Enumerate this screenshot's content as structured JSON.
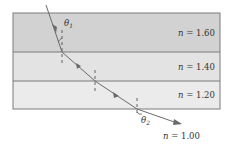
{
  "diagram": {
    "type": "refraction-through-layers",
    "colors": {
      "layer_1": "#d2d2d2",
      "layer_2": "#e3e3e3",
      "layer_3": "#ebebeb",
      "border": "#7a7a7a",
      "ray": "#6a6a6a",
      "background": "#ffffff"
    },
    "layers": [
      {
        "n_symbol": "n",
        "eq": " = 1.60"
      },
      {
        "n_symbol": "n",
        "eq": " = 1.40"
      },
      {
        "n_symbol": "n",
        "eq": " = 1.20"
      }
    ],
    "outside": {
      "n_symbol": "n",
      "eq": " = 1.00"
    },
    "angles": {
      "theta1": {
        "symbol": "θ",
        "sub": "1"
      },
      "theta2": {
        "symbol": "θ",
        "sub": "2"
      }
    }
  }
}
